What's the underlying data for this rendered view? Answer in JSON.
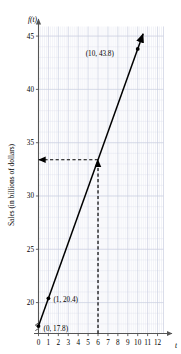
{
  "chart_data": {
    "type": "line",
    "title": "",
    "xlabel": "t",
    "ylabel": "f(t)",
    "y_axis_title": "Sales (in billions of dollars)",
    "x_ticks": [
      0,
      1,
      2,
      3,
      4,
      5,
      6,
      7,
      8,
      9,
      10,
      11,
      12
    ],
    "y_ticks": [
      20,
      25,
      30,
      35,
      40,
      45
    ],
    "xlim": [
      0,
      12.6
    ],
    "ylim": [
      17.1,
      45.9
    ],
    "grid": true,
    "grid_minor": true,
    "legend": "none",
    "axis_break_y": true,
    "series": [
      {
        "name": "f(t)",
        "type": "line",
        "equation_slope": 2.6,
        "equation_intercept": 17.8,
        "x": [
          0,
          1,
          10
        ],
        "y": [
          17.8,
          20.4,
          43.8
        ],
        "arrow_end": true,
        "line_color": "#000000"
      }
    ],
    "points": [
      {
        "label": "(0, 17.8)",
        "x": 0,
        "y": 17.8,
        "label_dx": 5,
        "label_dy": 5
      },
      {
        "label": "(1, 20.4)",
        "x": 1,
        "y": 20.4,
        "label_dx": 5,
        "label_dy": 4
      },
      {
        "label": "(10, 43.8)",
        "x": 10,
        "y": 43.8,
        "label_dx": -52,
        "label_dy": 7
      }
    ],
    "annotations": [
      {
        "name": "vertical-dashed-line",
        "type": "dashed-line",
        "x1": 6,
        "y1": 17.1,
        "x2": 6,
        "y2": 33.4,
        "arrow": "up"
      },
      {
        "name": "horizontal-dashed-arrow",
        "type": "dashed-arrow",
        "x1": 6,
        "y1": 33.4,
        "x2": 0,
        "y2": 33.4,
        "arrow": "left"
      }
    ],
    "colors": {
      "line": "#000000",
      "axis": "#555555",
      "grid_major": "#c9cfe0",
      "grid_minor": "#dde1ee",
      "dashed": "#000000",
      "background": "#ffffff"
    }
  }
}
